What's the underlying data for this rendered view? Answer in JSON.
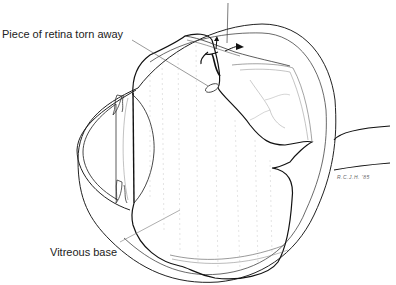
{
  "diagram": {
    "labels": {
      "retina_piece": "Piece of retina torn away",
      "vitreous_base": "Vitreous base"
    },
    "top_label_cropped": true,
    "signature": "R.C.J.H. '85"
  }
}
